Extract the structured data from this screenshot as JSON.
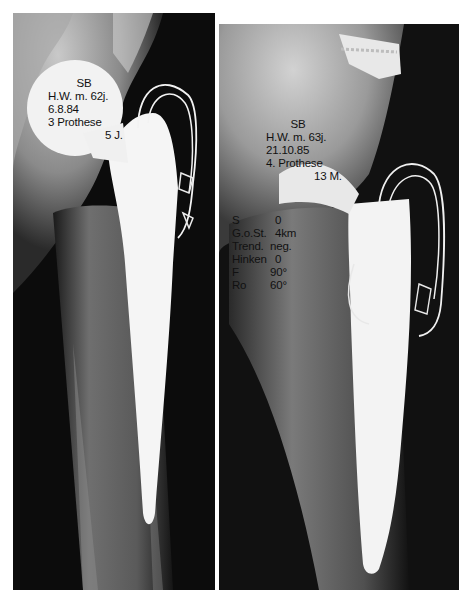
{
  "colors": {
    "background": "#ffffff",
    "film_dark": "#0b0b0b",
    "bone": "#b8b8b8",
    "implant": "#f4f4f4",
    "label_text": "#111111"
  },
  "left_radiograph": {
    "label": {
      "patient": "SB",
      "name_age": "H.W. m. 62j.",
      "date": "6.8.84",
      "prosthesis": "3 Prothese",
      "interval": "5 J."
    }
  },
  "right_radiograph": {
    "label": {
      "patient": "SB",
      "name_age": "H.W. m. 63j.",
      "date": "21.10.85",
      "prosthesis": "4. Prothese",
      "interval": "13 M."
    },
    "clinical_scores": [
      {
        "key": "S",
        "value": "0"
      },
      {
        "key": "G.o.St.",
        "value": "4km"
      },
      {
        "key": "Trend.",
        "value": "neg."
      },
      {
        "key": "Hinken",
        "value": "0"
      },
      {
        "key": "F",
        "value": "90°"
      },
      {
        "key": "Ro",
        "value": "60°"
      }
    ]
  }
}
